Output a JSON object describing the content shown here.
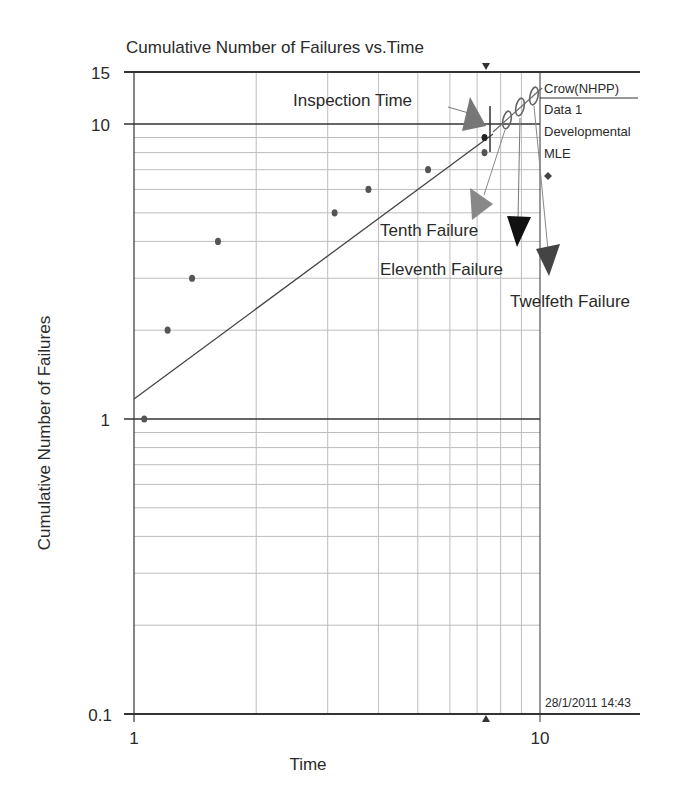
{
  "chart_data": {
    "type": "scatter",
    "title": "Cumulative Number of Failures vs.Time",
    "xlabel": "Time",
    "ylabel": "Cumulative Number of Failures",
    "xscale": "log",
    "yscale": "log",
    "xlim": [
      1,
      15
    ],
    "ylim": [
      0.1,
      15
    ],
    "x_tick_labels": [
      "1",
      "10"
    ],
    "y_tick_labels": [
      "0.1",
      "1",
      "10",
      "15"
    ],
    "grid": true,
    "legend": {
      "position": "right-top",
      "entries": [
        "Crow(NHPP)",
        "Data 1",
        "Developmental",
        "MLE"
      ]
    },
    "series": [
      {
        "name": "Data 1 (observed failures)",
        "marker": "dot",
        "points": [
          {
            "x": 1.06,
            "y": 1
          },
          {
            "x": 1.21,
            "y": 2
          },
          {
            "x": 1.39,
            "y": 3
          },
          {
            "x": 1.61,
            "y": 4
          },
          {
            "x": 3.12,
            "y": 5
          },
          {
            "x": 3.78,
            "y": 6
          },
          {
            "x": 5.3,
            "y": 7
          },
          {
            "x": 7.3,
            "y": 8
          },
          {
            "x": 7.3,
            "y": 9
          }
        ]
      },
      {
        "name": "Crow(NHPP) MLE fit line",
        "type": "line",
        "points": [
          {
            "x": 1.0,
            "y": 1.17
          },
          {
            "x": 7.5,
            "y": 9.3
          }
        ]
      },
      {
        "name": "Projected failures",
        "marker": "ellipse",
        "points": [
          {
            "x": 8.4,
            "y": 10.2
          },
          {
            "x": 9.2,
            "y": 11.3
          },
          {
            "x": 10.0,
            "y": 12.4
          }
        ]
      }
    ],
    "inspection_time": 7.35,
    "annotations": [
      {
        "text": "Inspection Time"
      },
      {
        "text": "Tenth Failure"
      },
      {
        "text": "Eleventh Failure"
      },
      {
        "text": "Twelfeth Failure"
      }
    ],
    "timestamp": "28/1/2011 14:43"
  },
  "labels": {
    "title": "Cumulative Number of Failures vs.Time",
    "xlabel": "Time",
    "ylabel": "Cumulative Number of Failures",
    "xtick_1": "1",
    "xtick_10": "10",
    "ytick_15": "15",
    "ytick_10": "10",
    "ytick_1": "1",
    "ytick_01": "0.1",
    "legend_0": "Crow(NHPP)",
    "legend_1": "Data 1",
    "legend_2": "Developmental",
    "legend_3": "MLE",
    "ann_inspection": "Inspection Time",
    "ann_tenth": "Tenth Failure",
    "ann_eleventh": "Eleventh Failure",
    "ann_twelfth": "Twelfeth Failure",
    "timestamp": "28/1/2011 14:43"
  },
  "colors": {
    "axis": "#333333",
    "grid": "#bdbdbd",
    "point": "#555555",
    "fit_line": "#444444",
    "arrow_gray": "#777777",
    "arrow_black": "#111111",
    "arrow_dark": "#444444"
  }
}
